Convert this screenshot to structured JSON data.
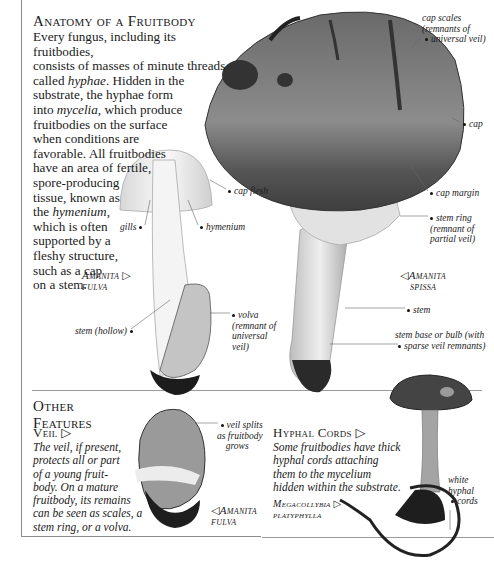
{
  "anatomy": {
    "title": "Anatomy of a Fruitbody",
    "intro_lines": [
      "Every fungus, including its fruitbodies,",
      "consists of masses of minute threads",
      "called ",
      "substrate, the hyphae form",
      "into ",
      "fruitbodies on the surface",
      "when conditions are",
      "favorable. All fruitbodies",
      "have an area of fertile,",
      "spore-producing",
      "tissue, known as",
      "the ",
      "which is often",
      "supported by a",
      "fleshy structure,",
      "such as a cap",
      "on a stem."
    ],
    "terms": {
      "hyphae": "hyphae",
      "hyphae_after": ". Hidden in the",
      "mycelia": "mycelia",
      "mycelia_after": ", which produce",
      "hymenium": "hymenium",
      "hymenium_after": ","
    }
  },
  "labels": {
    "cap_scales": [
      "cap scales",
      "(remnants of",
      "universal veil)"
    ],
    "cap": "cap",
    "cap_margin": "cap margin",
    "stem_ring": [
      "stem ring",
      "(remnant of",
      "partial veil)"
    ],
    "stem": "stem",
    "stem_base": [
      "stem base or bulb (with",
      "sparse veil remnants)"
    ],
    "cap_flesh": "cap flesh",
    "gills": "gills",
    "hymenium": "hymenium",
    "stem_hollow": "stem (hollow)",
    "volva": [
      "volva",
      "(remnant of",
      "universal",
      "veil)"
    ],
    "veil_splits": [
      "veil splits",
      "as fruitbody",
      "grows"
    ],
    "white_hyphal_cords": [
      "white",
      "hyphal",
      "cords"
    ]
  },
  "species": {
    "amanita_fulva_top": [
      "Amanita ▷",
      "fulva"
    ],
    "amanita_spissa": [
      "◁Amanita",
      "spissa"
    ],
    "amanita_fulva_bottom": [
      "◁Amanita",
      "fulva"
    ],
    "megacollybia": [
      "Megacollybia ▷",
      "platyphylla"
    ]
  },
  "other_features": {
    "title": "Other Features",
    "veil": {
      "heading": "Veil ▷",
      "lines": [
        "The veil, if present,",
        "protects all or part",
        "of a young fruit-",
        "body. On a mature",
        "fruitbody, its remains",
        "can be seen as scales, a",
        "stem ring, or a volva."
      ]
    },
    "hyphal_cords": {
      "heading": "Hyphal Cords ▷",
      "lines": [
        "Some fruitbodies have thick",
        "hyphal cords attaching",
        "them to the mycelium",
        "hidden within the substrate."
      ]
    }
  },
  "colors": {
    "text": "#1a1a1a",
    "rule": "#8c8c8c",
    "cap_dark": "#3a3a3a",
    "cap_mid": "#7a7a7a",
    "stem_light": "#e8e8e8"
  }
}
